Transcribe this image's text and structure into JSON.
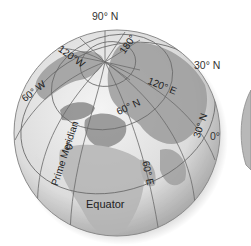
{
  "figure": {
    "colors": {
      "background": "#ffffff",
      "ocean": "#e8e8e8",
      "land": "#9a9a9a",
      "grid": "#6a6a6a",
      "text": "#222222"
    }
  },
  "labels": {
    "north_pole": "90° N",
    "lat_30": "30° N",
    "lat_0": "0°",
    "lon_120w": "120°W",
    "lon_180": "180°",
    "lon_60w": "60° W",
    "lon_120e": "120° E",
    "lat_60n": "60° N",
    "lat_30n_inner": "30° N",
    "prime_meridian": "Prime Meridian",
    "prime_meridian_deg": "0°",
    "lon_60e": "60° E",
    "equator": "Equator"
  }
}
